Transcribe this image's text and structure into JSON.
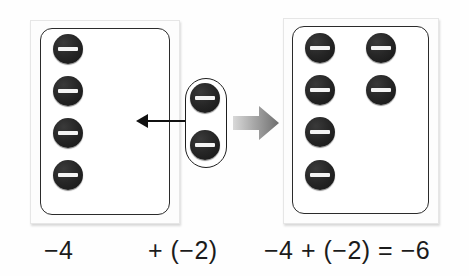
{
  "figure": {
    "counter_symbol": "minus-counter",
    "counter_color": "#1f1f1f",
    "counter_bar_color": "#f4f4f4",
    "frame_color": "#2b2b2b",
    "arrow_color": "#111111",
    "block_arrow_color": "#9a9a9a"
  },
  "left_group": {
    "name": "start-group",
    "count": 4,
    "value": "-4",
    "counters": [
      {
        "sign": "negative",
        "col": 0,
        "row": 0
      },
      {
        "sign": "negative",
        "col": 0,
        "row": 1
      },
      {
        "sign": "negative",
        "col": 0,
        "row": 2
      },
      {
        "sign": "negative",
        "col": 0,
        "row": 3
      }
    ]
  },
  "middle_group": {
    "name": "added-group",
    "count": 2,
    "value": "(-2)",
    "counters": [
      {
        "sign": "negative",
        "col": 0,
        "row": 0
      },
      {
        "sign": "negative",
        "col": 0,
        "row": 1
      }
    ]
  },
  "right_group": {
    "name": "result-group",
    "count": 6,
    "value": "-6",
    "counters": [
      {
        "sign": "negative",
        "col": 0,
        "row": 0
      },
      {
        "sign": "negative",
        "col": 1,
        "row": 0
      },
      {
        "sign": "negative",
        "col": 0,
        "row": 1
      },
      {
        "sign": "negative",
        "col": 1,
        "row": 1
      },
      {
        "sign": "negative",
        "col": 0,
        "row": 2
      },
      {
        "sign": "negative",
        "col": 0,
        "row": 3
      }
    ]
  },
  "labels": {
    "left": "−4",
    "middle": "+ (−2)",
    "right": "−4 + (−2) = −6"
  },
  "arrows": {
    "move_arrow": "arrow-left",
    "transform_arrow": "arrow-right"
  }
}
